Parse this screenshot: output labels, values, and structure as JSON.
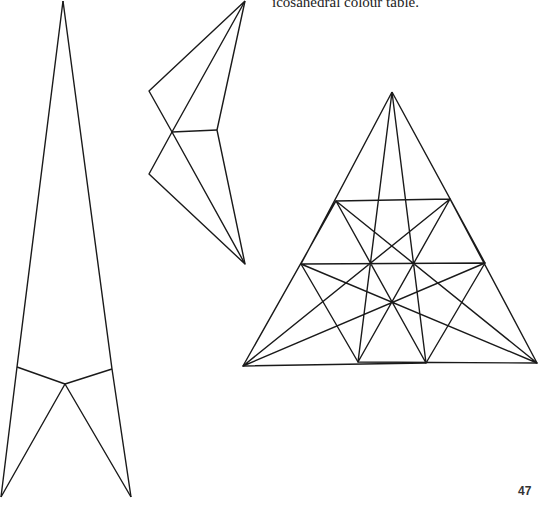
{
  "caption": "icosahedral colour table.",
  "page_number": "47",
  "colors": {
    "stroke": "#1a1a1a",
    "shade": "#d6d6d6",
    "background": "#ffffff"
  },
  "figures": {
    "tall_net": {
      "polylines": [
        [
          [
            63,
            1
          ],
          [
            17,
            367
          ],
          [
            1,
            497
          ]
        ],
        [
          [
            63,
            1
          ],
          [
            112,
            369
          ],
          [
            131,
            497
          ]
        ],
        [
          [
            17,
            367
          ],
          [
            65,
            384
          ],
          [
            112,
            369
          ]
        ],
        [
          [
            1,
            497
          ],
          [
            65,
            384
          ],
          [
            131,
            497
          ]
        ]
      ]
    },
    "folded_kite": {
      "polylines": [
        [
          [
            245,
            1
          ],
          [
            149,
            91
          ],
          [
            172,
            132
          ],
          [
            245,
            1
          ]
        ],
        [
          [
            245,
            1
          ],
          [
            217,
            130
          ],
          [
            245,
            264
          ]
        ],
        [
          [
            172,
            132
          ],
          [
            217,
            130
          ]
        ],
        [
          [
            172,
            132
          ],
          [
            149,
            174
          ],
          [
            245,
            264
          ],
          [
            172,
            132
          ]
        ]
      ]
    },
    "nine_point_star": {
      "vertices": [
        [
          392,
          92
        ],
        [
          450,
          199
        ],
        [
          485,
          263
        ],
        [
          537,
          363
        ],
        [
          426,
          363
        ],
        [
          358,
          362
        ],
        [
          243,
          366
        ],
        [
          301,
          264
        ],
        [
          336,
          201
        ]
      ],
      "star_step_outer": 4,
      "star_step_inner": 2
    }
  }
}
